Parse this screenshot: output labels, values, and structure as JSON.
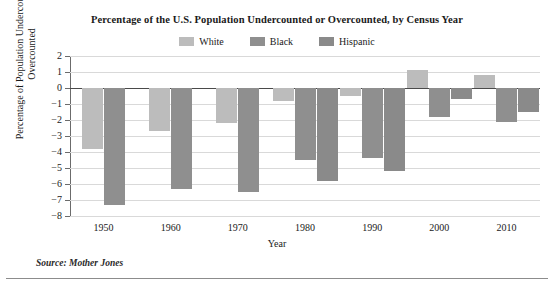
{
  "chart_data": {
    "type": "bar",
    "title": "Percentage of the U.S. Population Undercounted or Overcounted, by Census Year",
    "xlabel": "Year",
    "ylabel": "Percentage of Population Undercounted or Overcounted",
    "categories": [
      "1950",
      "1960",
      "1970",
      "1980",
      "1990",
      "2000",
      "2010"
    ],
    "series": [
      {
        "name": "White",
        "color": "#bcbcbc",
        "values": [
          -3.8,
          -2.7,
          -2.2,
          -0.8,
          -0.5,
          1.1,
          0.8
        ]
      },
      {
        "name": "Black",
        "color": "#8f8f8f",
        "values": [
          -7.3,
          -6.3,
          -6.5,
          -4.5,
          -4.4,
          -1.8,
          -2.1
        ]
      },
      {
        "name": "Hispanic",
        "color": "#8a8a8a",
        "values": [
          null,
          null,
          null,
          -5.8,
          -5.2,
          -0.7,
          -1.5
        ]
      }
    ],
    "ylim": [
      -8,
      2
    ],
    "yticks": [
      "2",
      "1",
      "0",
      "-1",
      "-2",
      "-3",
      "-4",
      "-5",
      "-6",
      "-7",
      "-8"
    ],
    "grid": true,
    "legend_position": "top-center",
    "source": "Source: Mother Jones"
  }
}
